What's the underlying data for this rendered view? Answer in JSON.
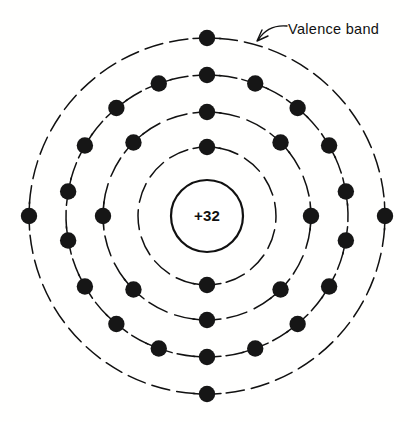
{
  "figure": {
    "background_color": "#ffffff",
    "ink_color": "#111111",
    "width": 410,
    "height": 422
  },
  "nucleus": {
    "label": "+32",
    "center_x": 207,
    "center_y": 216,
    "radius": 36
  },
  "annotation": {
    "label": "Valence band",
    "label_x": 288,
    "label_y": 34,
    "points_to": "outer-shell"
  },
  "chart_data": {
    "type": "diagram",
    "element_symbol": "+32",
    "nucleus_charge": 32,
    "total_electrons": 32,
    "shell_count": 4,
    "center": [
      207,
      216
    ],
    "shells": [
      {
        "name": "shell-1",
        "index": 1,
        "radius": 69,
        "electron_count": 2,
        "electron_angles_deg": [
          -90,
          90
        ]
      },
      {
        "name": "shell-2",
        "index": 2,
        "radius": 104,
        "electron_count": 8,
        "electron_angles_deg": [
          -90,
          -45,
          0,
          45,
          90,
          135,
          180,
          225
        ]
      },
      {
        "name": "shell-3",
        "index": 3,
        "radius": 141,
        "electron_count": 18,
        "electron_angles_deg": [
          -90,
          -70,
          -50,
          -30,
          -10,
          10,
          30,
          50,
          70,
          90,
          110,
          130,
          150,
          170,
          190,
          210,
          230,
          250
        ]
      },
      {
        "name": "shell-4",
        "index": 4,
        "radius": 178,
        "electron_count": 4,
        "electron_angles_deg": [
          -90,
          0,
          90,
          180
        ],
        "annotation": "Valence band"
      }
    ]
  }
}
